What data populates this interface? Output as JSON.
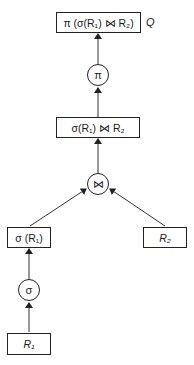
{
  "diagram": {
    "type": "query-tree",
    "nodes": {
      "result": {
        "label": "π (σ(R₁) ⋈ R₂)",
        "tag": "Q"
      },
      "project_op": {
        "label": "π"
      },
      "join_result": {
        "label": "σ(R₁) ⋈ R₂"
      },
      "join_op": {
        "label": "⋈"
      },
      "select_result": {
        "label": "σ (R₁)"
      },
      "r2": {
        "label": "R₂"
      },
      "select_op": {
        "label": "σ"
      },
      "r1": {
        "label": "R₁"
      }
    },
    "edges": [
      {
        "from": "r1",
        "to": "select_op"
      },
      {
        "from": "select_op",
        "to": "select_result"
      },
      {
        "from": "select_result",
        "to": "join_op"
      },
      {
        "from": "r2",
        "to": "join_op"
      },
      {
        "from": "join_op",
        "to": "join_result"
      },
      {
        "from": "join_result",
        "to": "project_op"
      },
      {
        "from": "project_op",
        "to": "result"
      }
    ]
  }
}
